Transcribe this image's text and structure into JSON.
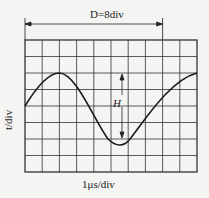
{
  "diagram": {
    "span_label": "D=8div",
    "x_axis_label": "1μs/div",
    "y_axis_label": "t/div",
    "amplitude_label": "H",
    "grid": {
      "columns": 10,
      "rows": 8
    },
    "waveform": "sine",
    "colors": {
      "line": "#1a1a1a",
      "background": "#f4f4f2"
    }
  }
}
